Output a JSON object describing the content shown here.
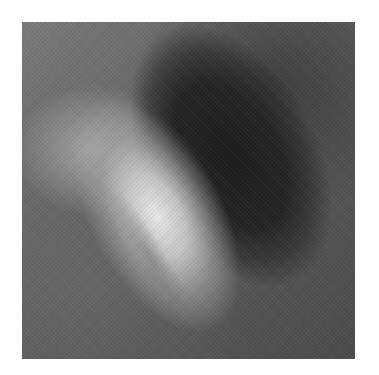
{
  "image": {
    "description": "Grayscale aerial/orbital photograph of an elongated mesa landform, brightly lit on the left and in deep shadow on the right",
    "colors": {
      "background": "#ffffff",
      "lit_surface": "#d8d8d8",
      "shadow": "#1e1e1e",
      "terrain": "#666666"
    }
  }
}
